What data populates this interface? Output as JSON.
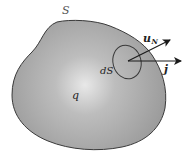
{
  "figure": {
    "surface_label": "S",
    "area_element_label": "dS",
    "charge_label": "q",
    "normal_vector": {
      "symbol": "u",
      "subscript": "N"
    },
    "current_vector": {
      "symbol": "j"
    }
  },
  "colors": {
    "region_fill_center": "#e6e6e6",
    "region_fill_edge": "#9a9a9a",
    "outline": "#3a3a3a",
    "arrow": "#1a1a1a",
    "background": "#ffffff"
  }
}
